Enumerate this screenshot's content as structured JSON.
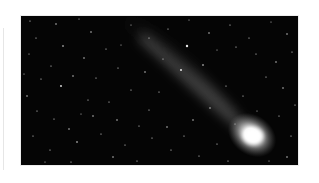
{
  "image": {
    "subject": "comet",
    "alt": "Comet with a long glowing tail against a star-filled night sky",
    "palette": {
      "page_background": "#ffffff",
      "sky": "#050505",
      "coma": "#ffffff",
      "tail": "#d8d8d8",
      "stars": "#e8e8e8"
    },
    "comet": {
      "head": {
        "x": 231,
        "y": 119
      },
      "tail_end": {
        "x": 100,
        "y": 10
      }
    }
  }
}
